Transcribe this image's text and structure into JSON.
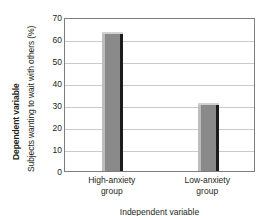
{
  "chart_data": {
    "type": "bar",
    "title": "",
    "categories": [
      "High-anxiety group",
      "Low-anxiety group"
    ],
    "values": [
      63,
      31
    ],
    "xlabel": "Independent variable",
    "ylabel": "Subjects wanting to wait with others (%)",
    "ylim": [
      0,
      70
    ],
    "ytick_step": 10,
    "yticks": [
      70,
      60,
      50,
      40,
      30,
      20,
      10,
      0
    ],
    "grid": true,
    "legend": false,
    "series": [
      {
        "name": "Subjects wanting to wait with others (%)",
        "values": [
          63,
          31
        ]
      }
    ],
    "colors": {
      "bar_fill": "#8a8a8a",
      "bar_highlight": "#bdbdbd",
      "bar_shadow": "#1c1c1c",
      "gridline": "#c9c9c9",
      "frame": "#7d7d7d",
      "text": "#231f20"
    }
  },
  "axes": {
    "dependent_variable_label": "Dependent variable",
    "y_axis_title": "Subjects wanting to wait with others (%)",
    "y_tick_labels": [
      "70",
      "60",
      "50",
      "40",
      "30",
      "20",
      "10",
      "0"
    ],
    "x_tick_labels": [
      {
        "line1": "High-anxiety",
        "line2": "group"
      },
      {
        "line1": "Low-anxiety",
        "line2": "group"
      }
    ]
  },
  "caption": {
    "bottom_clipped_text": "Independent variable"
  }
}
